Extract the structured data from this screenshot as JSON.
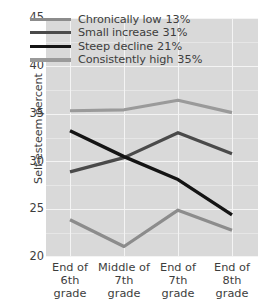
{
  "chart_data": {
    "type": "line",
    "title": "",
    "xlabel": "",
    "ylabel": "Self-esteem percent",
    "ylim": [
      20,
      45
    ],
    "yticks": [
      20,
      25,
      30,
      35,
      40,
      45
    ],
    "grid": true,
    "legend_position": "top-center-inside",
    "categories": [
      "End of\n6th\ngrade",
      "Middle of\n7th\ngrade",
      "End of\n7th\ngrade",
      "End of\n8th\ngrade"
    ],
    "category_lines": [
      [
        "End of",
        "6th",
        "grade"
      ],
      [
        "Middle of",
        "7th",
        "grade"
      ],
      [
        "End of",
        "7th",
        "grade"
      ],
      [
        "End of",
        "8th",
        "grade"
      ]
    ],
    "series": [
      {
        "name": "Chronically low",
        "share": "13%",
        "color": "#8c8c8c",
        "width": 3.2,
        "values": [
          23.9,
          21.1,
          24.9,
          22.8
        ]
      },
      {
        "name": "Small increase",
        "share": "31%",
        "color": "#4a4a4a",
        "width": 3.2,
        "values": [
          28.9,
          30.4,
          33.0,
          30.8
        ]
      },
      {
        "name": "Steep decline",
        "share": "21%",
        "color": "#141414",
        "width": 3.4,
        "values": [
          33.2,
          30.5,
          28.1,
          24.4
        ]
      },
      {
        "name": "Consistently high",
        "share": "35%",
        "color": "#9a9a9a",
        "width": 3.2,
        "values": [
          35.3,
          35.4,
          36.4,
          35.1
        ]
      }
    ]
  },
  "legend": {
    "items": [
      {
        "label": "Chronically low",
        "percent": "13%"
      },
      {
        "label": "Small increase",
        "percent": "31%"
      },
      {
        "label": "Steep decline",
        "percent": "21%"
      },
      {
        "label": "Consistently high",
        "percent": "35%"
      }
    ]
  },
  "axes": {
    "y_title": "Self-esteem percent",
    "y_ticks": [
      "45",
      "40",
      "35",
      "30",
      "25",
      "20"
    ],
    "x_ticks": [
      {
        "l1": "End of",
        "l2": "6th",
        "l3": "grade"
      },
      {
        "l1": "Middle of",
        "l2": "7th",
        "l3": "grade"
      },
      {
        "l1": "End of",
        "l2": "7th",
        "l3": "grade"
      },
      {
        "l1": "End of",
        "l2": "8th",
        "l3": "grade"
      }
    ]
  },
  "colors": {
    "plot_background": "#d9d9d9",
    "gridline": "#f4f4f4",
    "gridline_minor": "#e6e6e6",
    "text": "#3d3d3d"
  }
}
